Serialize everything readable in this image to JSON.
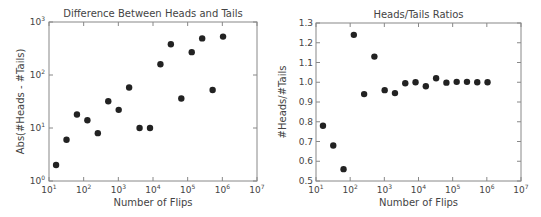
{
  "chart_data": [
    {
      "type": "scatter",
      "title": "Difference Between Heads and Tails",
      "xlabel": "Number of Flips",
      "ylabel": "Abs(#Heads - #Tails)",
      "xscale": "log",
      "yscale": "log",
      "xlim": [
        10,
        10000000
      ],
      "ylim": [
        1,
        1000
      ],
      "xticks": [
        "10^1",
        "10^2",
        "10^3",
        "10^4",
        "10^5",
        "10^6",
        "10^7"
      ],
      "yticks": [
        "10^0",
        "10^1",
        "10^2",
        "10^3"
      ],
      "grid": false,
      "marker_color": "#222222",
      "x": [
        16,
        32,
        64,
        128,
        256,
        512,
        1024,
        2048,
        4096,
        8192,
        16384,
        32768,
        65536,
        131072,
        262144,
        524288,
        1048576
      ],
      "y": [
        2,
        6,
        18,
        14,
        8,
        32,
        22,
        58,
        10,
        10,
        160,
        380,
        36,
        270,
        490,
        52,
        530
      ]
    },
    {
      "type": "scatter",
      "title": "Heads/Tails Ratios",
      "xlabel": "Number of Flips",
      "ylabel": "#Heads/#Tails",
      "xscale": "log",
      "yscale": "linear",
      "xlim": [
        10,
        10000000
      ],
      "ylim": [
        0.5,
        1.3
      ],
      "xticks": [
        "10^1",
        "10^2",
        "10^3",
        "10^4",
        "10^5",
        "10^6",
        "10^7"
      ],
      "yticks": [
        "0.5",
        "0.6",
        "0.7",
        "0.8",
        "0.9",
        "1.0",
        "1.1",
        "1.2",
        "1.3"
      ],
      "grid": false,
      "marker_color": "#222222",
      "x": [
        16,
        32,
        64,
        128,
        256,
        512,
        1024,
        2048,
        4096,
        8192,
        16384,
        32768,
        65536,
        131072,
        262144,
        524288,
        1048576
      ],
      "y": [
        0.78,
        0.68,
        0.56,
        1.24,
        0.94,
        1.13,
        0.96,
        0.945,
        0.995,
        1.0,
        0.98,
        1.02,
        0.998,
        1.002,
        1.002,
        1.0,
        1.0
      ]
    }
  ]
}
